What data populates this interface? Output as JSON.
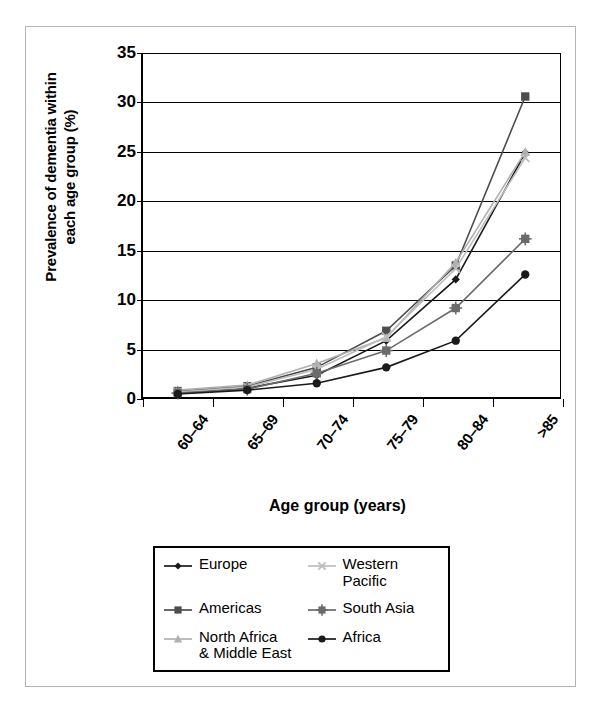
{
  "chart_data": {
    "type": "line",
    "title": "",
    "xlabel": "Age group (years)",
    "ylabel": "Prevalence of dementia within each age group (%)",
    "ylabel_line1": "Prevalence of dementia within",
    "ylabel_line2": "each age group (%)",
    "categories": [
      "60–64",
      "65–69",
      "70–74",
      "75–79",
      "80–84",
      ">85"
    ],
    "ylim": [
      0,
      35
    ],
    "yticks": [
      0,
      5,
      10,
      15,
      20,
      25,
      30,
      35
    ],
    "grid": true,
    "legend_position": "below-plot",
    "series": [
      {
        "name": "Europe",
        "marker": "diamond",
        "color": "#1a1a1a",
        "values": [
          0.6,
          1.1,
          2.4,
          5.9,
          12.1,
          24.9
        ]
      },
      {
        "name": "Americas",
        "marker": "square",
        "color": "#4d4d4d",
        "values": [
          0.8,
          1.3,
          3.2,
          6.9,
          13.5,
          30.6
        ]
      },
      {
        "name": "North Africa\n& Middle East",
        "marker": "triangle",
        "color": "#b0b0b0",
        "values": [
          0.9,
          1.4,
          3.6,
          6.2,
          13.8,
          25.0
        ]
      },
      {
        "name": "Western\nPacific",
        "marker": "cross",
        "color": "#bdbdbd",
        "values": [
          0.7,
          1.2,
          3.0,
          6.3,
          13.2,
          24.4
        ]
      },
      {
        "name": "South Asia",
        "marker": "crossed-square",
        "color": "#6b6b6b",
        "values": [
          0.6,
          1.0,
          2.6,
          4.9,
          9.2,
          16.2
        ]
      },
      {
        "name": "Africa",
        "marker": "circle",
        "color": "#1a1a1a",
        "values": [
          0.5,
          0.9,
          1.6,
          3.2,
          5.9,
          12.6
        ]
      }
    ]
  },
  "legend": {
    "entries": [
      {
        "label": "Europe",
        "marker": "diamond-marker"
      },
      {
        "label": "Western\nPacific",
        "marker": "cross-marker"
      },
      {
        "label": "Americas",
        "marker": "square-marker"
      },
      {
        "label": "South Asia",
        "marker": "crossed-square-marker"
      },
      {
        "label": "North Africa\n& Middle East",
        "marker": "triangle-marker"
      },
      {
        "label": "Africa",
        "marker": "circle-marker"
      }
    ]
  },
  "axis": {
    "ytick_labels": [
      "0",
      "5",
      "10",
      "15",
      "20",
      "25",
      "30",
      "35"
    ],
    "xtick_labels": [
      "60–64",
      "65–69",
      "70–74",
      "75–79",
      "80–84",
      ">85"
    ],
    "xtitle": "Age group (years)"
  },
  "colors": {
    "axis": "#000000",
    "frame": "#b4b4b4",
    "background": "#ffffff"
  }
}
